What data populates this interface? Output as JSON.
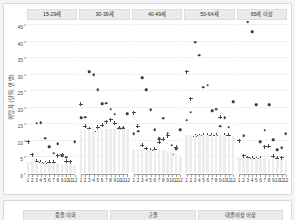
{
  "chart_data": {
    "type": "scatter",
    "title": "",
    "xlabel": "",
    "ylabel": "취업자 (단위: 만명)",
    "ylim": [
      0,
      46
    ],
    "yticks": [
      0,
      5,
      10,
      15,
      20,
      25,
      30,
      35,
      40,
      45
    ],
    "x": [
      1,
      2,
      3,
      4,
      5,
      6,
      7,
      8,
      9,
      10,
      11,
      12
    ],
    "xticklabels": [
      "1",
      "2",
      "3",
      "4",
      "5",
      "6",
      "7",
      "8",
      "9",
      "10",
      "11",
      "12"
    ],
    "grid": true,
    "legend_position": "none",
    "facet_labels": [
      "15-29세",
      "30-39세",
      "40-49세",
      "50-64세",
      "65세 이상"
    ],
    "panels": [
      {
        "facet": "15-29세",
        "series": [
          {
            "name": "dot",
            "marker": "circle",
            "values": [
              null,
              3.0,
              15.0,
              15.2,
              10.5,
              8.0,
              6.0,
              8.8,
              5.3,
              4.7,
              null,
              9.5
            ]
          },
          {
            "name": "plus",
            "marker": "plus",
            "values": [
              9.4,
              5.6,
              3.6,
              3.2,
              3.0,
              3.3,
              3.2,
              5.3,
              5.6,
              3.6,
              3.4,
              null
            ]
          },
          {
            "name": "bar",
            "marker": "bar",
            "values": [
              3.3,
              3.3,
              3.3,
              3.3,
              3.2,
              3.1,
              3.0,
              2.9,
              2.8,
              2.6,
              2.4,
              2.2
            ]
          }
        ]
      },
      {
        "facet": "30-39세",
        "series": [
          {
            "name": "dot",
            "marker": "circle",
            "values": [
              16.8,
              16.9,
              30.6,
              29.7,
              25.1,
              20.9,
              21.1,
              19.3,
              17.8,
              13.4,
              13.5,
              18.0
            ]
          },
          {
            "name": "plus",
            "marker": "plus",
            "values": [
              20.8,
              14.2,
              13.4,
              12.6,
              13.9,
              14.5,
              15.5,
              16.1,
              15.0,
              13.6,
              13.5,
              null
            ]
          },
          {
            "name": "bar",
            "marker": "bar",
            "values": [
              13.4,
              13.4,
              13.4,
              13.4,
              13.4,
              13.4,
              13.4,
              13.4,
              13.4,
              13.4,
              13.3,
              13.3
            ]
          }
        ]
      },
      {
        "facet": "40-49세",
        "series": [
          {
            "name": "dot",
            "marker": "circle",
            "values": [
              11.8,
              12.6,
              28.9,
              25.1,
              19.1,
              13.1,
              10.4,
              16.5,
              12.0,
              8.4,
              7.4,
              13.1
            ]
          },
          {
            "name": "plus",
            "marker": "plus",
            "values": [
              18.2,
              14.1,
              8.4,
              7.3,
              6.9,
              7.2,
              9.3,
              10.2,
              11.3,
              5.5,
              7.8,
              null
            ]
          },
          {
            "name": "bar",
            "marker": "bar",
            "values": [
              7.1,
              7.1,
              7.1,
              7.0,
              7.0,
              7.0,
              6.9,
              6.9,
              6.8,
              6.5,
              6.0,
              5.2
            ]
          }
        ]
      },
      {
        "facet": "50-64세",
        "series": [
          {
            "name": "dot",
            "marker": "circle",
            "values": [
              16.0,
              18.4,
              39.6,
              35.6,
              25.9,
              26.6,
              18.8,
              19.3,
              14.2,
              16.8,
              13.8,
              21.5
            ]
          },
          {
            "name": "plus",
            "marker": "plus",
            "values": [
              30.6,
              22.5,
              11.2,
              11.3,
              11.4,
              11.4,
              11.4,
              11.5,
              16.9,
              11.4,
              11.4,
              null
            ]
          },
          {
            "name": "bar",
            "marker": "bar",
            "values": [
              11.4,
              11.4,
              11.4,
              11.4,
              11.4,
              11.4,
              11.4,
              11.4,
              11.4,
              11.4,
              11.3,
              11.2
            ]
          }
        ]
      },
      {
        "facet": "65세 이상",
        "series": [
          {
            "name": "dot",
            "marker": "circle",
            "values": [
              4.2,
              11.2,
              45.8,
              42.7,
              20.6,
              9.4,
              12.9,
              20.6,
              10.0,
              7.0,
              7.6,
              11.8
            ]
          },
          {
            "name": "plus",
            "marker": "plus",
            "values": [
              9.7,
              5.2,
              4.6,
              4.4,
              4.3,
              4.4,
              7.9,
              8.1,
              5.0,
              4.5,
              4.6,
              null
            ]
          },
          {
            "name": "bar",
            "marker": "bar",
            "values": [
              4.4,
              4.4,
              4.4,
              4.4,
              4.4,
              4.4,
              4.4,
              4.3,
              4.3,
              4.2,
              4.0,
              3.6
            ]
          }
        ]
      }
    ]
  },
  "next_card": {
    "facet_labels": [
      "중졸 이하",
      "고졸",
      "대졸이상 이상"
    ]
  },
  "colors": {
    "dot": "#3a3a3a",
    "plus": "#4a4a4a",
    "bar": "#ededed",
    "strip": "#ebebeb",
    "grid": "#f0f0f0",
    "panel_border": "#d9d9d9"
  }
}
